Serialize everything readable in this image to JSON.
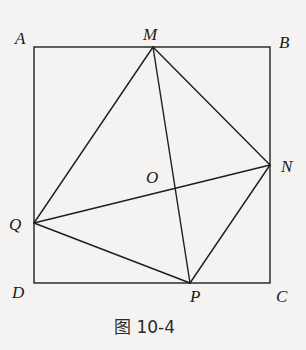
{
  "figure": {
    "caption": "图 10-4",
    "colors": {
      "background": "#f4f3f1",
      "line": "#1e1e1e",
      "text": "#1a1a1a"
    },
    "square": {
      "vertices": [
        "A",
        "B",
        "C",
        "D"
      ]
    },
    "points": {
      "A": {
        "label": "A",
        "x": 34,
        "y": 47
      },
      "B": {
        "label": "B",
        "x": 270,
        "y": 47
      },
      "C": {
        "label": "C",
        "x": 270,
        "y": 283
      },
      "D": {
        "label": "D",
        "x": 34,
        "y": 283
      },
      "M": {
        "label": "M",
        "x": 153,
        "y": 47
      },
      "N": {
        "label": "N",
        "x": 270,
        "y": 165
      },
      "P": {
        "label": "P",
        "x": 190,
        "y": 283
      },
      "Q": {
        "label": "Q",
        "x": 34,
        "y": 223
      },
      "O": {
        "label": "O",
        "x": 176,
        "y": 189
      }
    },
    "segments": [
      [
        "A",
        "B"
      ],
      [
        "B",
        "C"
      ],
      [
        "C",
        "D"
      ],
      [
        "D",
        "A"
      ],
      [
        "M",
        "N"
      ],
      [
        "N",
        "P"
      ],
      [
        "P",
        "Q"
      ],
      [
        "Q",
        "M"
      ],
      [
        "M",
        "P"
      ],
      [
        "Q",
        "N"
      ]
    ]
  }
}
